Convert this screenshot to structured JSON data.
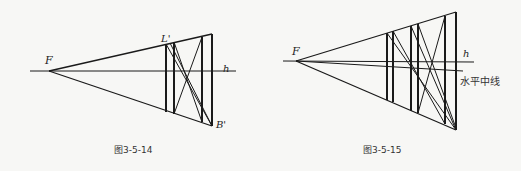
{
  "figures": [
    {
      "caption": "图3-5-14",
      "vanishing_point_label": "F",
      "horizon_label": "h",
      "point_top_label": "L'",
      "point_bottom_label": "B'"
    },
    {
      "caption": "图3-5-15",
      "vanishing_point_label": "F",
      "horizon_label": "h",
      "midline_label": "水平中线"
    }
  ],
  "colors": {
    "ink": "#1a1a1a",
    "paper": "#f7f7f5"
  }
}
